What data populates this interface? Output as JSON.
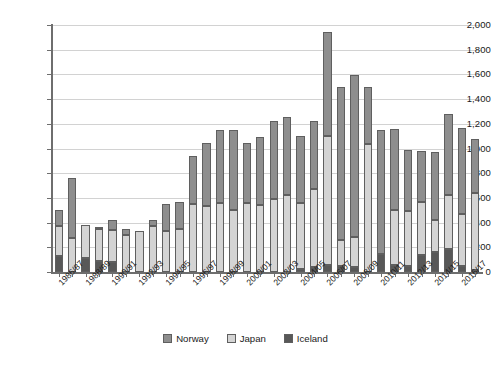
{
  "chart_data": {
    "type": "bar",
    "subtype": "stacked-bar",
    "title": "",
    "xlabel": "",
    "ylabel": "",
    "ylim": [
      0,
      2000
    ],
    "ytick_step": 200,
    "yticks": [
      "0",
      "200",
      "400",
      "600",
      "800",
      "1,000",
      "1,200",
      "1,400",
      "1,600",
      "1,800",
      "2,000"
    ],
    "grid": "horizontal",
    "legend_position": "bottom-center",
    "categories": [
      "1986/87",
      "1987/88",
      "1988/89",
      "1989/90",
      "1990/91",
      "1991/92",
      "1992/93",
      "1993/94",
      "1994/95",
      "1995/96",
      "1996/97",
      "1997/98",
      "1998/99",
      "1999/00",
      "2000/01",
      "2001/02",
      "2002/03",
      "2003/04",
      "2004/05",
      "2005/06",
      "2006/07",
      "2007/08",
      "2008/09",
      "2009/10",
      "2010/11",
      "2011/12",
      "2012/13",
      "2013/14",
      "2014/15",
      "2015/16",
      "2016/17",
      "2017/18"
    ],
    "tick_labels_shown": [
      "1986/87",
      "1988/89",
      "1990/91",
      "1992/93",
      "1994/95",
      "1996/97",
      "1998/99",
      "2000/01",
      "2002/03",
      "2004/05",
      "2006/07",
      "2008/09",
      "2010/11",
      "2012/13",
      "2014/15",
      "2016/17"
    ],
    "series": [
      {
        "name": "Iceland",
        "color": "#585858",
        "values": [
          130,
          0,
          115,
          90,
          85,
          0,
          0,
          0,
          0,
          0,
          0,
          0,
          0,
          0,
          0,
          0,
          0,
          0,
          25,
          39,
          60,
          45,
          38,
          0,
          148,
          60,
          52,
          134,
          161,
          184,
          46,
          17
        ]
      },
      {
        "name": "Japan",
        "color": "#d4d4d4",
        "values": [
          241,
          273,
          265,
          255,
          258,
          300,
          330,
          375,
          330,
          350,
          554,
          538,
          555,
          505,
          555,
          545,
          590,
          620,
          530,
          637,
          1040,
          215,
          245,
          1040,
          0,
          440,
          444,
          430,
          260,
          437,
          427,
          620
        ]
      },
      {
        "name": "Norway",
        "color": "#8e8e8e",
        "values": [
          135,
          487,
          0,
          15,
          82,
          45,
          0,
          50,
          218,
          217,
          388,
          503,
          591,
          645,
          487,
          552,
          634,
          639,
          544,
          545,
          845,
          1240,
          1310,
          460,
          1000,
          655,
          488,
          412,
          551,
          660,
          690,
          440
        ]
      }
    ],
    "totals": [
      506,
      760,
      380,
      360,
      425,
      345,
      330,
      425,
      548,
      567,
      942,
      1041,
      1146,
      1150,
      1042,
      1097,
      1224,
      1259,
      1099,
      1221,
      1945,
      1500,
      1593,
      1500,
      1148,
      1155,
      984,
      976,
      972,
      1281,
      1163,
      1077
    ],
    "legend": [
      "Norway",
      "Japan",
      "Iceland"
    ]
  },
  "legend": {
    "items": [
      {
        "label": "Norway"
      },
      {
        "label": "Japan"
      },
      {
        "label": "Iceland"
      }
    ]
  }
}
